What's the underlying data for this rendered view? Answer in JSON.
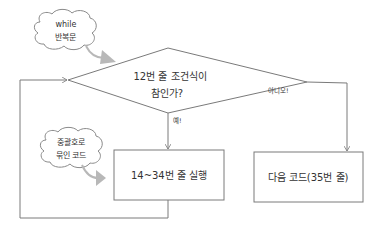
{
  "colors": {
    "line": "#7a7a7a",
    "text": "#333333",
    "arrow_gray": "#b8b8b8",
    "background": "#ffffff"
  },
  "diagram": {
    "type": "flowchart",
    "decision": {
      "line1": "12번 줄 조건식이",
      "line2": "참인가?"
    },
    "yes_label": "예!",
    "no_label": "아니오!",
    "loop_body_box": "14~34번 줄 실행",
    "next_code_box": "다음 코드(35번 줄)",
    "callouts": [
      {
        "line1": "while",
        "line2": "반복문"
      },
      {
        "line1": "중괄호로",
        "line2": "묶인 코드"
      }
    ]
  }
}
